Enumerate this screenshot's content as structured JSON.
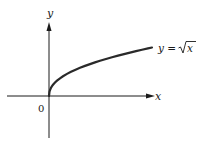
{
  "diagram": {
    "axes": {
      "x_label": "x",
      "y_label": "y",
      "origin_label": "0"
    },
    "curve": {
      "label_lhs": "y =",
      "label_radicand": "x",
      "function": "sqrt"
    },
    "colors": {
      "ink": "#1a1a1a",
      "curve": "#2a2a2a",
      "background": "#ffffff"
    }
  }
}
